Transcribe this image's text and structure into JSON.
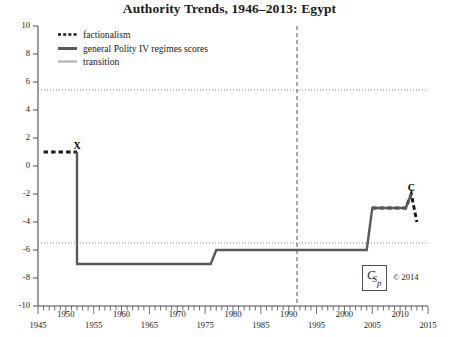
{
  "chart_data": {
    "type": "line",
    "title": "Authority Trends, 1946–2013: Egypt",
    "xlabel": "",
    "ylabel": "",
    "xlim": [
      1945,
      2015
    ],
    "ylim": [
      -10,
      10
    ],
    "grid": "dotted horizontal reference lines at +6 and -6",
    "legend_position": "top-left inside plot",
    "x_ticks": [
      1945,
      1950,
      1955,
      1960,
      1965,
      1970,
      1975,
      1980,
      1985,
      1990,
      1995,
      2000,
      2005,
      2010,
      2015
    ],
    "x_tick_labels": [
      "1945",
      "1950",
      "1955",
      "1960",
      "1965",
      "1970",
      "1975",
      "1980",
      "1985",
      "1990",
      "1995",
      "2000",
      "2005",
      "2010",
      "2015"
    ],
    "y_ticks": [
      -10,
      -8,
      -6,
      -4,
      -2,
      0,
      2,
      4,
      6,
      8,
      10
    ],
    "y_tick_labels": [
      "-10",
      "-8",
      "-6",
      "-4",
      "-2",
      "0",
      "2",
      "4",
      "6",
      "8",
      "10"
    ],
    "reference_lines": {
      "horizontal_dotted": [
        6,
        -6
      ],
      "vertical_dashed": [
        1991
      ]
    },
    "series": [
      {
        "name": "factionalism",
        "style": "dashed",
        "color": "#1a1a1a",
        "points": [
          {
            "x": 1946,
            "y": 1
          },
          {
            "x": 1952,
            "y": 1
          }
        ]
      },
      {
        "name": "factionalism",
        "style": "dashed",
        "color": "#1a1a1a",
        "points": [
          {
            "x": 2005,
            "y": -3
          },
          {
            "x": 2011,
            "y": -3
          },
          {
            "x": 2012,
            "y": -2
          },
          {
            "x": 2013,
            "y": -4
          }
        ]
      },
      {
        "name": "general Polity IV regimes scores",
        "style": "solid-thick",
        "color": "#595959",
        "points": [
          {
            "x": 1952,
            "y": 1
          },
          {
            "x": 1952,
            "y": -7
          },
          {
            "x": 1976,
            "y": -7
          },
          {
            "x": 1977,
            "y": -6
          },
          {
            "x": 2004,
            "y": -6
          },
          {
            "x": 2005,
            "y": -3
          },
          {
            "x": 2011,
            "y": -3
          },
          {
            "x": 2012,
            "y": -2
          }
        ]
      },
      {
        "name": "transition",
        "style": "solid-thin",
        "color": "#b3b3b3",
        "points": []
      }
    ],
    "annotations": [
      {
        "label": "X",
        "x": 1952,
        "y": 1
      },
      {
        "label": "C",
        "x": 2012,
        "y": -2
      }
    ]
  },
  "legend": {
    "items": [
      {
        "label": "factionalism",
        "swatch": "dashed-black"
      },
      {
        "label": "general Polity IV regimes scores",
        "swatch": "solid-dark-gray"
      },
      {
        "label": "transition",
        "swatch": "solid-light-gray"
      }
    ]
  },
  "footer": {
    "logo_text": "CSp",
    "copyright": "© 2014"
  },
  "colors": {
    "polity_line": "#595959",
    "factionalism_line": "#1a1a1a",
    "transition_line": "#b3b3b3",
    "axis": "#4d4d4d",
    "gridline": "#808080",
    "background": "#ffffff"
  }
}
